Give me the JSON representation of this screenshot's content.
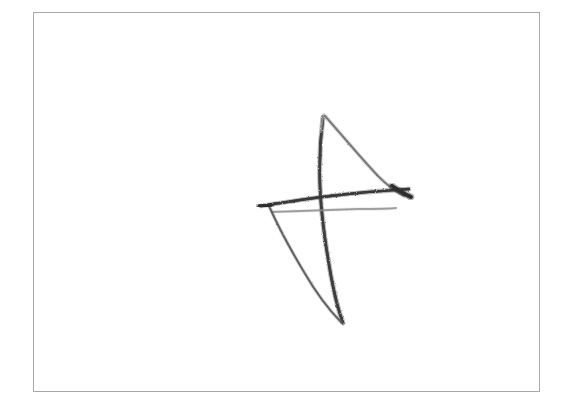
{
  "canvas": {
    "width": 571,
    "height": 412,
    "background_color": "#ffffff",
    "medium": "pencil-sketch-on-paper"
  },
  "frame": {
    "name": "page-border",
    "x": 33,
    "y": 12,
    "width": 507,
    "height": 380,
    "border_color": "#a8a8a8",
    "border_width": 1,
    "fill_color": "#ffffff"
  },
  "artwork": {
    "title": "hand-drawn-angular-figure",
    "description": "Sketched arrow / stylized letter-A form built from five overlapping graphite strokes",
    "ink_color": "#3a3a3a",
    "ink_color_light": "#8d8d8d",
    "bounds": {
      "x": 258,
      "y": 112,
      "width": 155,
      "height": 215
    },
    "strokes": [
      {
        "name": "stroke-vertical-spine",
        "description": "Near-vertical spine descending from faint apex to bottom tail",
        "path": "M 323 117 C 320 140 319 162 320 186 C 321 214 326 248 331 276 C 335 298 339 312 343 323",
        "color": "#3f3f3f",
        "width": 2.6,
        "opacity": 0.92
      },
      {
        "name": "stroke-apex-highlight",
        "description": "Very faint upper tip of the spine",
        "path": "M 324 114 C 322 121 321 126 321 132",
        "color": "#b5b5b5",
        "width": 1.8,
        "opacity": 0.55
      },
      {
        "name": "stroke-right-diagonal",
        "description": "Diagonal sweeping from apex down to the dark right node",
        "path": "M 325 116 C 341 134 360 157 378 176 C 388 186 396 192 404 196",
        "color": "#6e6e6e",
        "width": 2.2,
        "opacity": 0.8
      },
      {
        "name": "stroke-horizontal-main",
        "description": "Main crossbar rising slightly to the right, ending in a dark node",
        "path": "M 261 206 C 292 201 326 196 358 193 C 378 191 395 190 409 189",
        "color": "#3a3a3a",
        "width": 2.4,
        "opacity": 0.95
      },
      {
        "name": "stroke-horizontal-secondary",
        "description": "Fainter second crossbar just below the main one",
        "path": "M 272 212 C 302 211 332 210 358 209 C 375 209 387 209 396 208",
        "color": "#8a8a8a",
        "width": 1.8,
        "opacity": 0.7
      },
      {
        "name": "stroke-right-node",
        "description": "Dark convergence mark where diagonal meets crossbar",
        "path": "M 392 186 C 398 190 404 194 411 197",
        "color": "#2e2e2e",
        "width": 3.6,
        "opacity": 0.95
      },
      {
        "name": "stroke-lower-left-diagonal",
        "description": "Left leg starting dark at crossbar and fading toward bottom convergence",
        "path": "M 269 206 C 277 224 289 247 304 272 C 318 296 331 312 341 322",
        "color": "#595959",
        "width": 2.1,
        "opacity": 0.85
      },
      {
        "name": "stroke-left-tip",
        "description": "Dark nub at the left end of the crossbar",
        "path": "M 259 206 C 263 206 267 206 271 205",
        "color": "#2e2e2e",
        "width": 3.2,
        "opacity": 0.9
      }
    ]
  }
}
